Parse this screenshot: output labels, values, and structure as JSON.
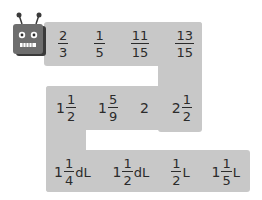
{
  "robot": {
    "icon": "robot-icon",
    "colors": {
      "body": "#6e6e6e",
      "eyes": "#ffffff",
      "antenna": "#3a3a3a"
    }
  },
  "colors": {
    "path": "#c8c8c8",
    "text": "#2b2b2b",
    "background": "#ffffff"
  },
  "rows": [
    {
      "items": [
        {
          "whole": "",
          "num": "2",
          "den": "3",
          "unit": ""
        },
        {
          "whole": "",
          "num": "1",
          "den": "5",
          "unit": ""
        },
        {
          "whole": "",
          "num": "11",
          "den": "15",
          "unit": ""
        },
        {
          "whole": "",
          "num": "13",
          "den": "15",
          "unit": ""
        }
      ]
    },
    {
      "items": [
        {
          "whole": "1",
          "num": "1",
          "den": "2",
          "unit": ""
        },
        {
          "whole": "1",
          "num": "5",
          "den": "9",
          "unit": ""
        },
        {
          "whole": "2",
          "num": "",
          "den": "",
          "unit": ""
        },
        {
          "whole": "2",
          "num": "1",
          "den": "2",
          "unit": ""
        }
      ]
    },
    {
      "items": [
        {
          "whole": "1",
          "num": "1",
          "den": "4",
          "unit": "dL"
        },
        {
          "whole": "1",
          "num": "1",
          "den": "2",
          "unit": "dL"
        },
        {
          "whole": "",
          "num": "1",
          "den": "2",
          "unit": "L"
        },
        {
          "whole": "1",
          "num": "1",
          "den": "5",
          "unit": "L"
        }
      ]
    }
  ]
}
